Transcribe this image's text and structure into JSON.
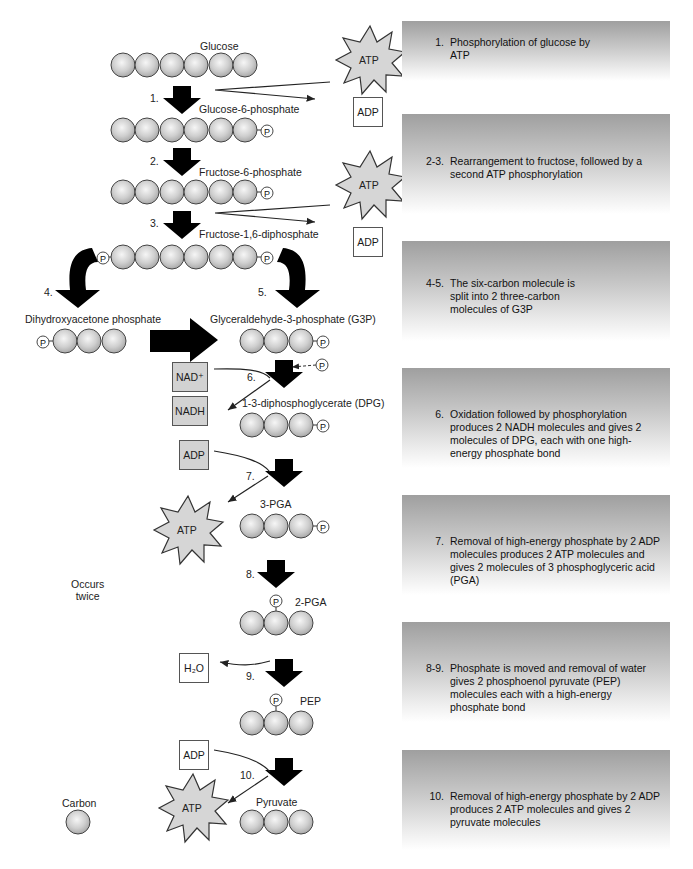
{
  "diagram": {
    "molecules": {
      "glucose": "Glucose",
      "g6p": "Glucose-6-phosphate",
      "f6p": "Fructose-6-phosphate",
      "f16dp": "Fructose-1,6-diphosphate",
      "dhap": "Dihydroxyacetone phosphate",
      "g3p": "Glyceraldehyde-3-phosphate (G3P)",
      "dpg": "1-3-diphosphoglycerate (DPG)",
      "pga3": "3-PGA",
      "pga2": "2-PGA",
      "pep": "PEP",
      "pyruvate": "Pyruvate"
    },
    "step_numbers": [
      "1.",
      "2.",
      "3.",
      "4.",
      "5.",
      "6.",
      "7.",
      "8.",
      "9.",
      "10."
    ],
    "cofactors": {
      "atp": "ATP",
      "adp": "ADP",
      "nad_plus": "NAD⁺",
      "nadh": "NADH",
      "water": "H₂O",
      "phosphate": "P"
    },
    "side_note": [
      "Occurs",
      "twice"
    ],
    "legend": {
      "carbon_label": "Carbon"
    }
  },
  "panels": [
    {
      "num": "1.",
      "text": "Phosphorylation of glucose by ATP"
    },
    {
      "num": "2-3.",
      "text": "Rearrangement to fructose, followed by a second ATP phosphorylation"
    },
    {
      "num": "4-5.",
      "text": "The six-carbon molecule is split into 2 three-carbon molecules of G3P"
    },
    {
      "num": "6.",
      "text": "Oxidation followed by phosphorylation produces 2 NADH molecules and gives 2 molecules of DPG, each with one high-energy phosphate bond"
    },
    {
      "num": "7.",
      "text": "Removal of high-energy phosphate by 2 ADP molecules produces 2 ATP molecules and gives 2 molecules of 3 phosphoglyceric acid (PGA)"
    },
    {
      "num": "8-9.",
      "text": "Phosphate is moved and removal of water gives 2 phosphoenol pyruvate (PEP) molecules each with a high-energy phosphate bond"
    },
    {
      "num": "10.",
      "text": "Removal of high-energy phosphate by 2 ADP produces 2 ATP molecules and gives 2 pyruvate molecules"
    }
  ],
  "colors": {
    "sphere": "#c8c8c8",
    "sphere_highlight": "#f4f4f4",
    "outline": "#333333",
    "arrow": "#000000",
    "star_fill": "#d6d6d6",
    "panel_top": "#9f9f9f",
    "panel_bottom": "#ffffff"
  }
}
